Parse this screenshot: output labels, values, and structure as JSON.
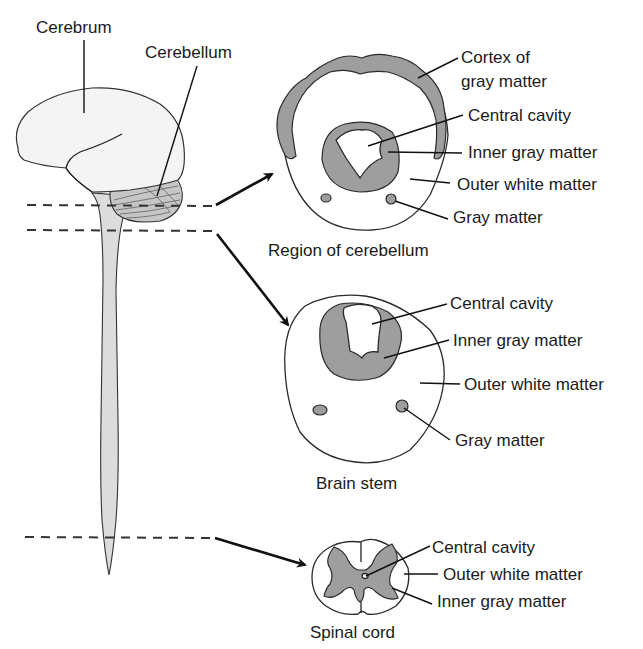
{
  "colors": {
    "background": "#ffffff",
    "gray_matter": "#9e9e9e",
    "white_matter": "#ffffff",
    "brain_fill": "#f4f4f4",
    "stem_fill": "#dcdcdc",
    "line": "#1a1a1a"
  },
  "brain": {
    "labels": {
      "cerebrum": "Cerebrum",
      "cerebellum": "Cerebellum"
    }
  },
  "sections": {
    "cerebellum": {
      "title": "Region of cerebellum",
      "labels": {
        "cortex_line1": "Cortex of",
        "cortex_line2": "gray matter",
        "central_cavity": "Central cavity",
        "inner_gray": "Inner gray matter",
        "outer_white": "Outer white matter",
        "gray_matter": "Gray matter"
      }
    },
    "brain_stem": {
      "title": "Brain stem",
      "labels": {
        "central_cavity": "Central cavity",
        "inner_gray": "Inner gray matter",
        "outer_white": "Outer white matter",
        "gray_matter": "Gray matter"
      }
    },
    "spinal_cord": {
      "title": "Spinal cord",
      "labels": {
        "central_cavity": "Central cavity",
        "outer_white": "Outer white matter",
        "inner_gray": "Inner gray matter"
      }
    }
  }
}
